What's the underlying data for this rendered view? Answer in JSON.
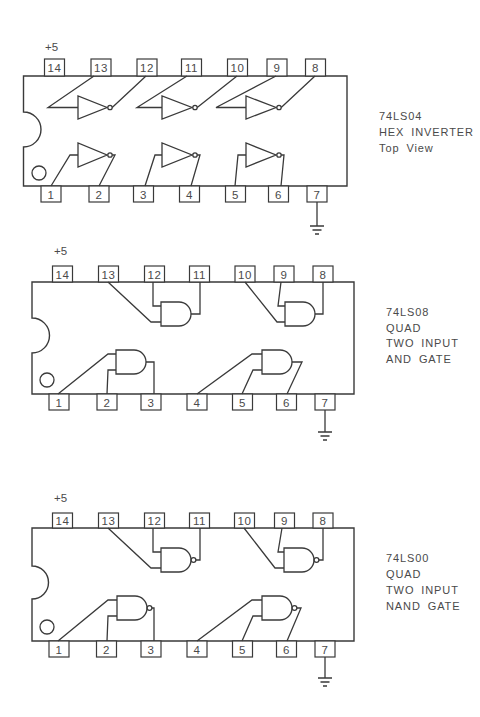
{
  "colors": {
    "line": "#3a3a3a",
    "text": "#4a4a4a",
    "background": "#ffffff"
  },
  "chips": [
    {
      "supply_label": "+5",
      "label_lines": [
        "74LS04",
        "HEX INVERTER",
        "Top View"
      ],
      "top_pins": [
        "14",
        "13",
        "12",
        "11",
        "10",
        "9",
        "8"
      ],
      "bottom_pins": [
        "1",
        "2",
        "3",
        "4",
        "5",
        "6",
        "7"
      ],
      "gate_symbol": "inverter-gate-icon",
      "gate_count": 6,
      "ground_symbol": "ground-icon"
    },
    {
      "supply_label": "+5",
      "label_lines": [
        "74LS08",
        "QUAD",
        "TWO INPUT",
        "AND GATE"
      ],
      "top_pins": [
        "14",
        "13",
        "12",
        "11",
        "10",
        "9",
        "8"
      ],
      "bottom_pins": [
        "1",
        "2",
        "3",
        "4",
        "5",
        "6",
        "7"
      ],
      "gate_symbol": "and-gate-icon",
      "gate_count": 4,
      "ground_symbol": "ground-icon"
    },
    {
      "supply_label": "+5",
      "label_lines": [
        "74LS00",
        "QUAD",
        "TWO INPUT",
        "NAND GATE"
      ],
      "top_pins": [
        "14",
        "13",
        "12",
        "11",
        "10",
        "9",
        "8"
      ],
      "bottom_pins": [
        "1",
        "2",
        "3",
        "4",
        "5",
        "6",
        "7"
      ],
      "gate_symbol": "nand-gate-icon",
      "gate_count": 4,
      "ground_symbol": "ground-icon"
    }
  ]
}
